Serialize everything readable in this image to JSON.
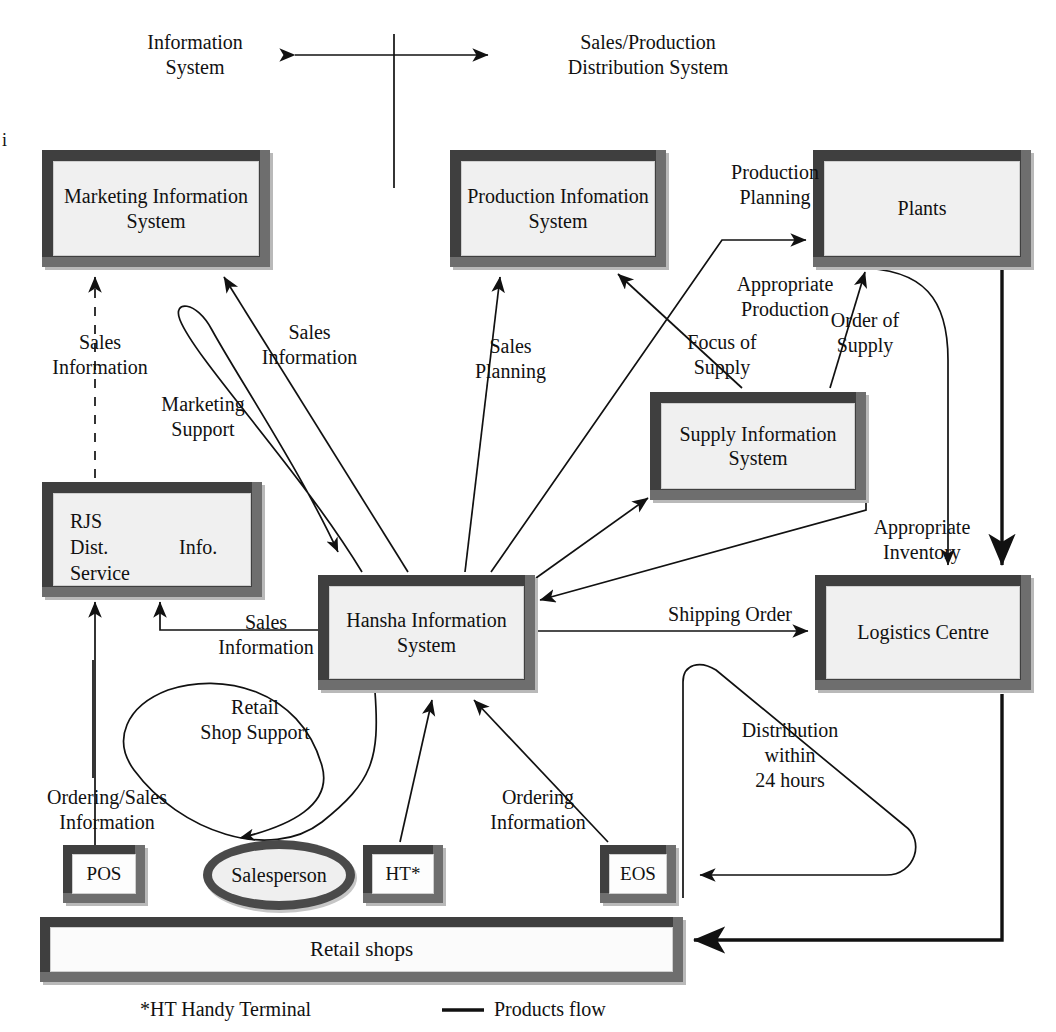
{
  "header": {
    "left_label": "Information\nSystem",
    "right_label": "Sales/Production\nDistribution System",
    "divider_icon": "vertical-divider",
    "scope_arrow_icon": "double-headed-arrow"
  },
  "margin_artifact": "i",
  "nodes": {
    "marketing_is": "Marketing\nInformation\nSystem",
    "production_is": "Production\nInfomation\nSystem",
    "plants": "Plants",
    "supply_is": "Supply\nInformation\nSystem",
    "rjs_name": "RJS\nDist.\nService",
    "rjs_info": "Info.",
    "hansha_is": "Hansha\nInformation\nSystem",
    "logistics_centre": "Logistics\nCentre",
    "pos": "POS",
    "salesperson": "Salesperson",
    "ht": "HT*",
    "eos": "EOS",
    "retail_shops": "Retail shops"
  },
  "flow_labels": {
    "sales_information_mis": "Sales\nInformation",
    "sales_information_hansha_mis": "Sales\nInformation",
    "marketing_support": "Marketing\nSupport",
    "sales_information_rjs": "Sales\nInformation",
    "sales_planning": "Sales\nPlanning",
    "production_planning": "Production\nPlanning",
    "appropriate_production": "Appropriate\nProduction",
    "focus_of_supply": "Focus of\nSupply",
    "order_of_supply": "Order of\nSupply",
    "appropriate_inventory": "Appropriate\nInventory",
    "shipping_order": "Shipping Order",
    "retail_shop_support": "Retail\nShop Support",
    "ordering_sales_information": "Ordering/Sales\nInformation",
    "ordering_information": "Ordering\nInformation",
    "distribution_within_24_hours": "Distribution\nwithin\n24 hours"
  },
  "legend": {
    "footnote": "*HT Handy Terminal",
    "products_flow": "Products flow",
    "products_flow_icon": "solid-line-swatch"
  },
  "colors": {
    "frame_dark": "#3f3f3f",
    "frame_light": "#b9b9b9",
    "fill": "#f0f0f0",
    "stroke": "#111111",
    "background": "#ffffff"
  }
}
